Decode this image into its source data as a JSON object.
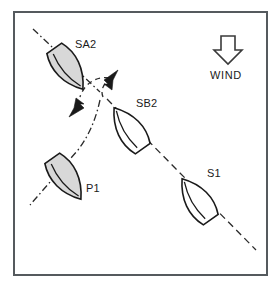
{
  "diagram": {
    "frame": {
      "border_color": "#555a5e",
      "background": "#ffffff"
    },
    "wind": {
      "label": "WIND",
      "icon": "down-arrow-icon",
      "direction": "down",
      "color": "#1a1a1a"
    },
    "style": {
      "hull_outline": "#1a1a1a",
      "hull_shaded_fill": "#d8d8d8",
      "hull_white_fill": "#ffffff",
      "track_color": "#2a2a2a"
    },
    "boats": [
      {
        "label": "SA2",
        "tack": "port",
        "shaded": true,
        "heading_deg": 145,
        "label_pos": {
          "x": 75,
          "y": 38
        },
        "hull_pos": {
          "x": 41,
          "y": 42
        }
      },
      {
        "label": "SB2",
        "tack": "starboard",
        "shaded": false,
        "heading_deg": 315,
        "label_pos": {
          "x": 136,
          "y": 97
        },
        "hull_pos": {
          "x": 104,
          "y": 106
        }
      },
      {
        "label": "P1",
        "tack": "port",
        "shaded": true,
        "heading_deg": 145,
        "label_pos": {
          "x": 86,
          "y": 182
        },
        "hull_pos": {
          "x": 40,
          "y": 152
        }
      },
      {
        "label": "S1",
        "tack": "starboard",
        "shaded": false,
        "heading_deg": 315,
        "label_pos": {
          "x": 207,
          "y": 167
        },
        "hull_pos": {
          "x": 172,
          "y": 176
        }
      }
    ],
    "tracks": [
      {
        "name": "port-tack-track",
        "style": "dash-dot",
        "from": "upper-left",
        "to": "lower-left"
      },
      {
        "name": "starboard-tack-track",
        "style": "dashed",
        "from": "crossing-point",
        "to": "lower-right"
      }
    ],
    "arrows": [
      {
        "name": "turn-arrow-up-right",
        "direction": "up-right"
      },
      {
        "name": "turn-arrow-down-left",
        "direction": "down-left"
      },
      {
        "name": "turn-arc",
        "style": "dashed-arc"
      }
    ]
  }
}
